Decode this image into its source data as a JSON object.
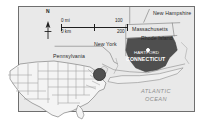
{
  "map": {
    "title": "Connecticut regional locator map",
    "background_color": "#e9e9e9",
    "frame_color": "#6f6f6f",
    "highlight_color": "#4f4f4f",
    "ocean_label_color": "#8d8d8d"
  },
  "compass": {
    "label": "N"
  },
  "scale": {
    "miles_zero": "0 mi",
    "miles_max": "100",
    "km_zero": "0 km",
    "km_max": "200"
  },
  "labels": {
    "pennsylvania": "Pennsylvania",
    "new_york": "New York",
    "new_hampshire": "New Hampshire",
    "massachusetts": "Massachusetts",
    "rhode_island": "Rhode Island",
    "connecticut": "CONNECTICUT",
    "hartford": "HARTFORD",
    "atlantic_ocean_line1": "ATLANTIC",
    "atlantic_ocean_line2": "OCEAN"
  },
  "inset": {
    "name": "United States locator inset",
    "marker_state": "Connecticut"
  }
}
